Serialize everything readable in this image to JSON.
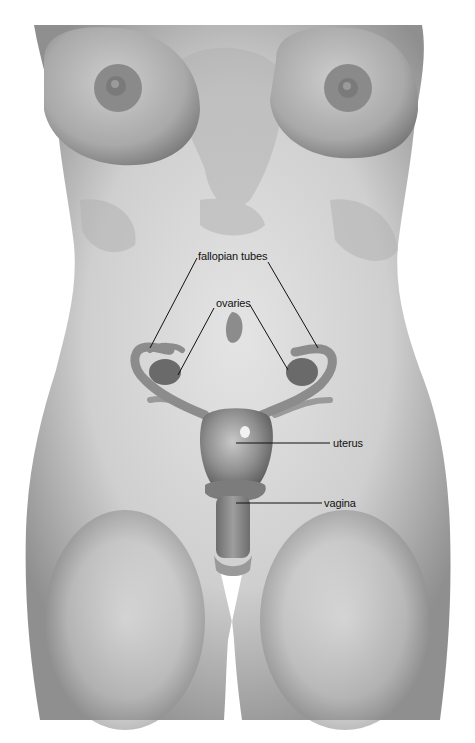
{
  "diagram": {
    "colors": {
      "background": "#ffffff",
      "skin_light": "#d9d9d9",
      "skin_mid": "#b5b5b5",
      "skin_dark": "#8a8a8a",
      "organ": "#8e8e8e",
      "organ_dark": "#6a6a6a",
      "leader_line": "#111111",
      "label_text": "#111111"
    },
    "labels": [
      {
        "id": "fallopian-tubes",
        "text": "fallopian tubes",
        "x": 198,
        "y": 250
      },
      {
        "id": "ovaries",
        "text": "ovaries",
        "x": 216,
        "y": 297
      },
      {
        "id": "uterus",
        "text": "uterus",
        "x": 333,
        "y": 437
      },
      {
        "id": "vagina",
        "text": "vagina",
        "x": 324,
        "y": 497
      }
    ],
    "leader_lines": [
      {
        "label": "fallopian-tubes",
        "x1": 197,
        "y1": 258,
        "x2": 150,
        "y2": 348
      },
      {
        "label": "fallopian-tubes",
        "x1": 268,
        "y1": 262,
        "x2": 318,
        "y2": 348
      },
      {
        "label": "ovaries",
        "x1": 214,
        "y1": 308,
        "x2": 178,
        "y2": 375
      },
      {
        "label": "ovaries",
        "x1": 250,
        "y1": 305,
        "x2": 288,
        "y2": 370
      },
      {
        "label": "uterus",
        "x1": 236,
        "y1": 443,
        "x2": 330,
        "y2": 443
      },
      {
        "label": "vagina",
        "x1": 236,
        "y1": 503,
        "x2": 322,
        "y2": 503
      }
    ]
  }
}
